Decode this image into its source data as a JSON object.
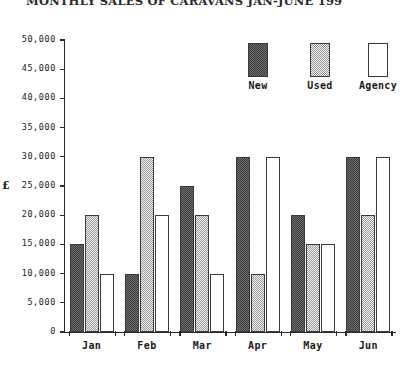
{
  "chart_data": {
    "type": "bar",
    "title": "MONTHLY SALES OF CARAVANS JAN-JUNE 199",
    "xlabel": "",
    "ylabel": "£",
    "categories": [
      "Jan",
      "Feb",
      "Mar",
      "Apr",
      "May",
      "Jun"
    ],
    "series": [
      {
        "name": "New",
        "values": [
          15000,
          10000,
          25000,
          30000,
          20000,
          30000
        ],
        "fill": "dark-checker",
        "color": "#5a5a5a"
      },
      {
        "name": "Used",
        "values": [
          20000,
          30000,
          20000,
          10000,
          15000,
          20000
        ],
        "fill": "light-checker",
        "color": "#d6d6d6"
      },
      {
        "name": "Agency",
        "values": [
          10000,
          20000,
          10000,
          30000,
          15000,
          30000
        ],
        "fill": "empty",
        "color": "#ffffff"
      }
    ],
    "ylim": [
      0,
      50000
    ],
    "ytick_step": 5000,
    "ytick_labels": [
      "50,000",
      "45,000",
      "40,000",
      "35,000",
      "30,000",
      "25,000",
      "20,000",
      "15,000",
      "10,000",
      "5,000",
      "0"
    ],
    "ytick_values": [
      50000,
      45000,
      40000,
      35000,
      30000,
      25000,
      20000,
      15000,
      10000,
      5000,
      0
    ],
    "grid": false,
    "legend_position": "top-right",
    "currency_label_at": 25000
  },
  "legend": {
    "entries": [
      {
        "label": "New"
      },
      {
        "label": "Used"
      },
      {
        "label": "Agency"
      }
    ]
  }
}
